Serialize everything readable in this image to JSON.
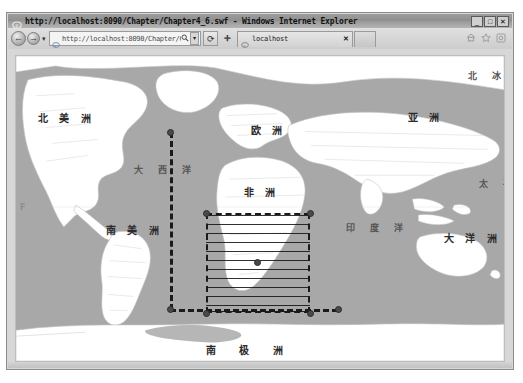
{
  "window": {
    "title": "http://localhost:8090/Chapter/Chapter4_6.swf - Windows Internet Explorer",
    "minimize_label": "_",
    "maximize_label": "□",
    "close_label": "✕"
  },
  "navbar": {
    "back_label": "←",
    "forward_label": "→",
    "history_dropdown_label": "▾",
    "url_value": "http://localhost:8090/Chapter/Chapter4",
    "url_placeholder": "Search or enter address",
    "search_icon": "search-icon",
    "url_dropdown_label": "▾",
    "refresh_label": "⟳",
    "stop_label": "✛",
    "home_icon": "home-icon",
    "favorites_icon": "star-icon",
    "tools_icon": "gear-icon"
  },
  "tabs": {
    "items": [
      {
        "title": "localhost",
        "close_label": "✕"
      }
    ],
    "new_tab_label": ""
  },
  "map": {
    "continents": [
      {
        "name": "north-america",
        "text": "北 美 洲",
        "x": 22,
        "y": 58
      },
      {
        "name": "south-america",
        "text": "南 美 洲",
        "x": 90,
        "y": 170
      },
      {
        "name": "europe",
        "text": "欧 洲",
        "x": 235,
        "y": 70
      },
      {
        "name": "asia",
        "text": "亚 洲",
        "x": 392,
        "y": 57
      },
      {
        "name": "africa",
        "text": "非 洲",
        "x": 228,
        "y": 132
      },
      {
        "name": "oceania",
        "text": "大 洋 洲",
        "x": 428,
        "y": 178
      },
      {
        "name": "antarctica",
        "text": "南 极 洲",
        "x": 190,
        "y": 290
      }
    ],
    "oceans": [
      {
        "name": "arctic-ocean",
        "text": "北 冰",
        "x": 452,
        "y": 16
      },
      {
        "name": "atlantic-ocean",
        "text": "大 西 洋",
        "x": 118,
        "y": 110
      },
      {
        "name": "pacific-ocean",
        "text": "太 平",
        "x": 463,
        "y": 124
      },
      {
        "name": "indian-ocean",
        "text": "印 度 洋",
        "x": 330,
        "y": 168
      }
    ],
    "left_edge_mark": "F",
    "selection": {
      "x": 190,
      "y": 157,
      "width": 104,
      "height": 100,
      "fill_pattern": "horizontal-lines",
      "border_style": "dashed",
      "border_color": "#1a1a1a",
      "handle_color": "#4a4a4a",
      "center_handle": true
    },
    "guide": {
      "vertical_x": 154,
      "vertical_top": 76,
      "vertical_bottom": 253,
      "horizontal_y": 253,
      "horizontal_right": 322,
      "color": "#1a1a1a",
      "style": "dashed"
    },
    "land_color": "#ffffff",
    "water_color": "#a8a8a8",
    "border_color": "#c8c8c8"
  }
}
